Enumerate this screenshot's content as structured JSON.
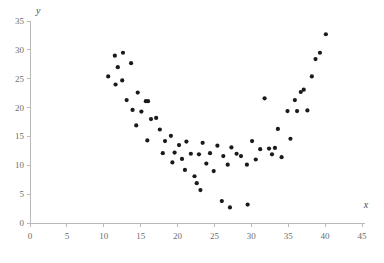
{
  "chart_data": {
    "type": "scatter",
    "title": "",
    "subtitle": "",
    "xlabel": "x",
    "ylabel": "y",
    "xlim": [
      0,
      45
    ],
    "ylim": [
      0,
      35
    ],
    "xticks": [
      0,
      5,
      10,
      15,
      20,
      25,
      30,
      35,
      40,
      45
    ],
    "yticks": [
      0,
      5,
      10,
      15,
      20,
      25,
      30,
      35
    ],
    "grid": false,
    "legend": null,
    "marker": "dot",
    "marker_color": "#1a1a1a",
    "marker_size": 2.1,
    "axis_color": "#b9b9b9",
    "tick_label_color": "#6d6d6d",
    "annotations": [],
    "series": [
      {
        "name": "observations",
        "points": [
          [
            10.6,
            25.4
          ],
          [
            11.5,
            29.0
          ],
          [
            11.9,
            27.0
          ],
          [
            11.6,
            24.0
          ],
          [
            12.6,
            29.5
          ],
          [
            12.5,
            24.7
          ],
          [
            13.7,
            27.7
          ],
          [
            13.1,
            21.3
          ],
          [
            13.9,
            19.6
          ],
          [
            14.6,
            22.6
          ],
          [
            15.1,
            19.3
          ],
          [
            15.7,
            21.1
          ],
          [
            16.0,
            21.1
          ],
          [
            14.4,
            16.9
          ],
          [
            16.4,
            18.0
          ],
          [
            17.1,
            18.2
          ],
          [
            15.9,
            14.3
          ],
          [
            17.6,
            16.2
          ],
          [
            18.3,
            14.2
          ],
          [
            18.0,
            12.1
          ],
          [
            19.1,
            15.1
          ],
          [
            19.6,
            12.2
          ],
          [
            19.3,
            10.5
          ],
          [
            20.2,
            13.5
          ],
          [
            20.6,
            11.1
          ],
          [
            21.2,
            14.1
          ],
          [
            21.0,
            9.2
          ],
          [
            21.8,
            12.0
          ],
          [
            22.3,
            8.1
          ],
          [
            22.6,
            6.9
          ],
          [
            23.1,
            5.7
          ],
          [
            22.9,
            11.9
          ],
          [
            23.4,
            13.9
          ],
          [
            23.9,
            10.3
          ],
          [
            24.4,
            12.1
          ],
          [
            24.9,
            9.0
          ],
          [
            25.4,
            13.4
          ],
          [
            26.0,
            3.8
          ],
          [
            26.2,
            11.6
          ],
          [
            26.8,
            10.1
          ],
          [
            27.1,
            2.7
          ],
          [
            27.3,
            13.1
          ],
          [
            28.0,
            12.0
          ],
          [
            28.6,
            11.6
          ],
          [
            29.5,
            3.2
          ],
          [
            29.4,
            10.1
          ],
          [
            30.1,
            14.2
          ],
          [
            30.6,
            11.0
          ],
          [
            31.2,
            12.8
          ],
          [
            31.8,
            21.6
          ],
          [
            32.4,
            12.9
          ],
          [
            32.8,
            11.9
          ],
          [
            33.2,
            13.0
          ],
          [
            33.6,
            16.3
          ],
          [
            34.1,
            11.4
          ],
          [
            34.9,
            19.4
          ],
          [
            35.3,
            14.6
          ],
          [
            35.9,
            21.3
          ],
          [
            36.2,
            19.4
          ],
          [
            36.7,
            22.7
          ],
          [
            37.1,
            23.1
          ],
          [
            37.6,
            19.5
          ],
          [
            38.2,
            25.4
          ],
          [
            38.7,
            28.4
          ],
          [
            39.3,
            29.5
          ],
          [
            40.1,
            32.7
          ]
        ]
      }
    ]
  },
  "axes": {
    "x_title": "x",
    "y_title": "y",
    "x_tick_labels": [
      "0",
      "5",
      "10",
      "15",
      "20",
      "25",
      "30",
      "35",
      "40",
      "45"
    ],
    "y_tick_labels": [
      "0",
      "5",
      "10",
      "15",
      "20",
      "25",
      "30",
      "35"
    ]
  }
}
